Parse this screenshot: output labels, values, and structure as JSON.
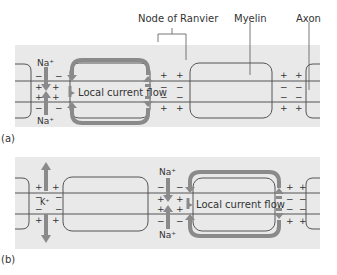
{
  "labels": {
    "node_of_ranvier": "Node of Ranvier",
    "myelin": "Myelin",
    "axon": "Axon",
    "panel_a": "(a)",
    "panel_b": "(b)",
    "local_current_flow_a": "Local current flow",
    "local_current_flow_b": "Local current flow",
    "na_top_a": "Na⁺",
    "na_bottom_a": "Na⁺",
    "na_top_b": "Na⁺",
    "na_bottom_b": "Na⁺",
    "k_b": "K⁺"
  },
  "charges": {
    "plus": "+",
    "minus": "−"
  },
  "colors": {
    "band": "#e9e9e9",
    "arrow": "#8a8a8a",
    "line": "#555555",
    "text": "#333333"
  }
}
